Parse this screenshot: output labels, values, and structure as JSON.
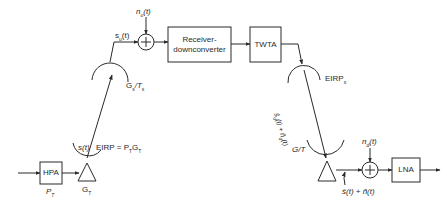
{
  "diagram": {
    "type": "satellite-link-block-diagram",
    "blocks": {
      "hpa": "HPA",
      "receiver": "Receiver-\ndownconverter",
      "receiver_line1": "Receiver-",
      "receiver_line2": "downconverter",
      "twta": "TWTA",
      "lna": "LNA"
    },
    "labels": {
      "hpa_power": "P",
      "hpa_power_sub": "T",
      "tx_gain": "G",
      "tx_gain_sub": "T",
      "uplink_signal": "s(t)",
      "eirp_tx": "EIRP = P",
      "eirp_tx_sub1": "T",
      "eirp_tx_g": "G",
      "eirp_tx_sub2": "T",
      "sat_rx_signal": "s",
      "sat_rx_signal_sub": "u",
      "sat_rx_signal_rest": "(t)",
      "uplink_noise": "n",
      "uplink_noise_sub": "u",
      "uplink_noise_rest": "(t)",
      "sat_g_over_t": "G",
      "sat_g_over_t_sub1": "s",
      "sat_g_over_t_mid": "/T",
      "sat_g_over_t_sub2": "s",
      "eirp_sat": "EIRP",
      "eirp_sat_sub": "s",
      "downlink_signal": "ŝ",
      "downlink_signal_sub": "d",
      "downlink_signal_rest": "(t) + ñ",
      "downlink_signal_sub2": "d",
      "downlink_signal_rest2": "(t)",
      "earth_g_over_t": "G/T",
      "downlink_noise": "n",
      "downlink_noise_sub": "d",
      "downlink_noise_rest": "(t)",
      "received_output": "ŝ(t) + ñ(t)"
    },
    "summers": [
      "uplink-noise-summer",
      "downlink-noise-summer"
    ],
    "colors": {
      "line": "#2a2a2a",
      "background": "#ffffff"
    }
  }
}
